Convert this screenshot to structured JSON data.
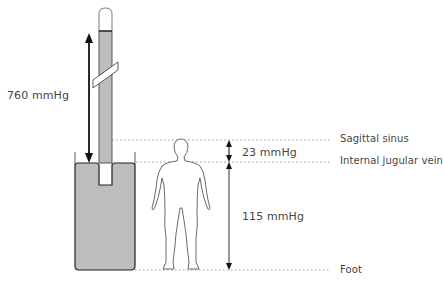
{
  "diagram": {
    "type": "barometer-venous-pressure-comparison",
    "left_measure": {
      "label": "760 mmHg"
    },
    "right_measures": [
      {
        "label": "23 mmHg",
        "from": "Sagittal sinus",
        "to": "Internal jugular vein"
      },
      {
        "label": "115 mmHg",
        "from": "Internal jugular vein",
        "to": "Foot"
      }
    ],
    "levels": [
      {
        "name": "Sagittal sinus"
      },
      {
        "name": "Internal jugular vein"
      },
      {
        "name": "Foot"
      }
    ]
  },
  "colors": {
    "fluid": "#bdbdbd",
    "outline": "#222222",
    "dotted": "#9a9a9a",
    "text": "#444444"
  }
}
